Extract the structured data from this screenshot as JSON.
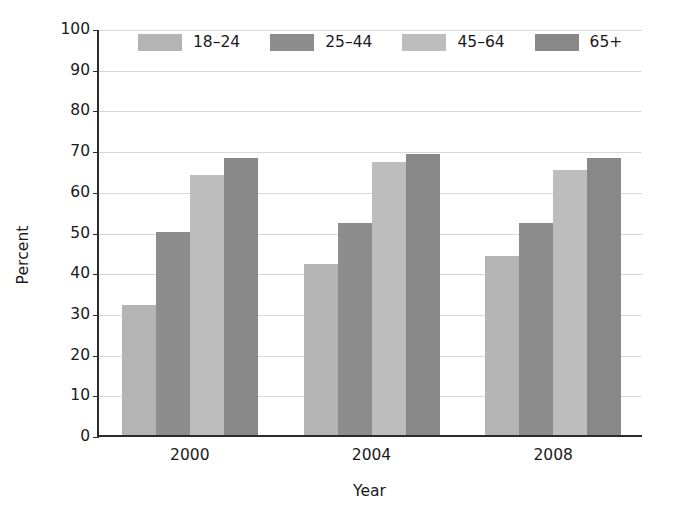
{
  "chart_data": {
    "type": "bar",
    "title": "",
    "xlabel": "Year",
    "ylabel": "Percent",
    "categories": [
      "2000",
      "2004",
      "2008"
    ],
    "series": [
      {
        "name": "18-24",
        "label": "18–24",
        "color": "#b4b4b4",
        "values": [
          32,
          42,
          44
        ]
      },
      {
        "name": "25-44",
        "label": "25–44",
        "color": "#8d8d8d",
        "values": [
          50,
          52,
          52
        ]
      },
      {
        "name": "45-64",
        "label": "45–64",
        "color": "#bdbdbd",
        "values": [
          64,
          67,
          65
        ]
      },
      {
        "name": "65+",
        "label": "65+",
        "color": "#888888",
        "values": [
          68,
          69,
          68
        ]
      }
    ],
    "ylim": [
      0,
      100
    ],
    "ytick_step": 10,
    "yticks": [
      "100",
      "90",
      "80",
      "70",
      "60",
      "50",
      "40",
      "30",
      "20",
      "10",
      "0"
    ],
    "grid": true,
    "legend_position": "top-inside",
    "axis_color": "#2b2b2b",
    "gridline_color": "#d8d8d8",
    "background": "#ffffff"
  }
}
